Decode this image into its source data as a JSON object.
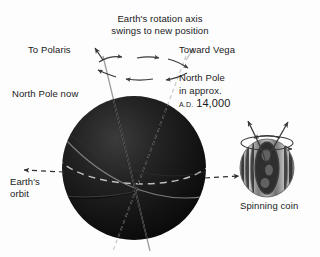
{
  "figure": {
    "title_lines": [
      "Earth's rotation axis",
      "swings to new position"
    ],
    "labels": {
      "to_polaris": "To Polaris",
      "toward_vega": "Toward Vega",
      "north_pole_now": "North Pole now",
      "north_pole_future_line1": "North Pole",
      "north_pole_future_line2": "in approx.",
      "north_pole_future_era": "A.D.",
      "north_pole_future_year": "14,000",
      "earths_orbit_line1": "Earth's",
      "earths_orbit_line2": "orbit",
      "spinning_coin": "Spinning coin"
    },
    "colors": {
      "background": "#fdfdfd",
      "text": "#1a1a1a",
      "earth_dark": "#141414",
      "earth_mid": "#2a2a2a",
      "line": "#555555",
      "arrow": "#3a3a3a",
      "dashed": "#c8c8c8",
      "coin_light": "#d8d8d8",
      "coin_dark": "#4a4a4a"
    },
    "icons": {
      "precession_arrows": "circular-arrows-icon",
      "orbit_arrow": "dashed-arrow-left-icon",
      "earth_orbit_arrow": "dashed-arrow-right-icon",
      "coin_spin_arrows": "spin-arrows-icon"
    }
  }
}
